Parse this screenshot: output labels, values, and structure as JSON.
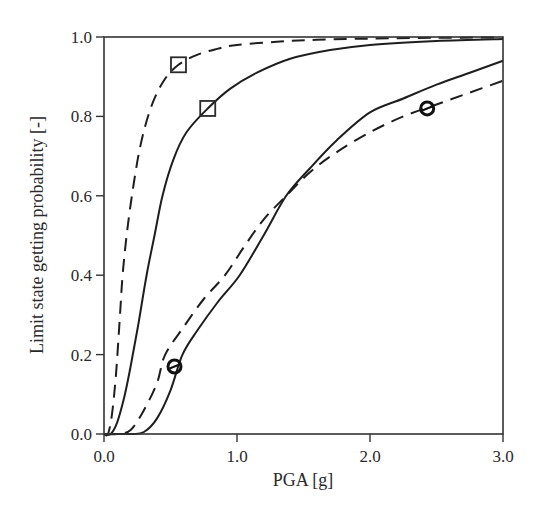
{
  "chart_data": {
    "type": "line",
    "title": "",
    "xlabel": "PGA  [g]",
    "ylabel": "Limit state getting probability [-]",
    "xlim": [
      0.0,
      3.0
    ],
    "ylim": [
      0.0,
      1.0
    ],
    "x_ticks": [
      "0.0",
      "1.0",
      "2.0",
      "3.0"
    ],
    "y_ticks": [
      "0.0",
      "0.2",
      "0.4",
      "0.6",
      "0.8",
      "1.0"
    ],
    "grid": false,
    "legend": null,
    "series": [
      {
        "name": "Square marker - dashed",
        "style": "dashed",
        "marker": "square",
        "marker_point": [
          0.56,
          0.93
        ],
        "points": [
          [
            0.0,
            0.0
          ],
          [
            0.03,
            0.0
          ],
          [
            0.06,
            0.05
          ],
          [
            0.09,
            0.15
          ],
          [
            0.12,
            0.3
          ],
          [
            0.14,
            0.4
          ],
          [
            0.17,
            0.5
          ],
          [
            0.21,
            0.6
          ],
          [
            0.27,
            0.72
          ],
          [
            0.35,
            0.82
          ],
          [
            0.45,
            0.89
          ],
          [
            0.56,
            0.93
          ],
          [
            0.7,
            0.955
          ],
          [
            0.85,
            0.97
          ],
          [
            1.0,
            0.98
          ],
          [
            1.3,
            0.988
          ],
          [
            1.6,
            0.993
          ],
          [
            2.0,
            0.996
          ],
          [
            2.5,
            0.998
          ],
          [
            3.0,
            0.999
          ]
        ]
      },
      {
        "name": "Square marker - solid",
        "style": "solid",
        "marker": "square",
        "marker_point": [
          0.78,
          0.82
        ],
        "points": [
          [
            0.0,
            0.0
          ],
          [
            0.05,
            0.0
          ],
          [
            0.1,
            0.03
          ],
          [
            0.15,
            0.09
          ],
          [
            0.2,
            0.17
          ],
          [
            0.26,
            0.28
          ],
          [
            0.32,
            0.4
          ],
          [
            0.38,
            0.5
          ],
          [
            0.44,
            0.6
          ],
          [
            0.52,
            0.69
          ],
          [
            0.62,
            0.76
          ],
          [
            0.78,
            0.82
          ],
          [
            0.95,
            0.87
          ],
          [
            1.15,
            0.91
          ],
          [
            1.4,
            0.945
          ],
          [
            1.7,
            0.967
          ],
          [
            2.0,
            0.98
          ],
          [
            2.5,
            0.99
          ],
          [
            3.0,
            0.995
          ]
        ]
      },
      {
        "name": "Circle marker - dashed",
        "style": "dashed",
        "marker": "circle",
        "marker_point": [
          0.53,
          0.17
        ],
        "points": [
          [
            0.0,
            0.0
          ],
          [
            0.1,
            0.0
          ],
          [
            0.2,
            0.01
          ],
          [
            0.3,
            0.06
          ],
          [
            0.4,
            0.13
          ],
          [
            0.46,
            0.2
          ],
          [
            0.6,
            0.27
          ],
          [
            0.75,
            0.34
          ],
          [
            0.91,
            0.4
          ],
          [
            1.05,
            0.47
          ],
          [
            1.2,
            0.54
          ],
          [
            1.37,
            0.6
          ],
          [
            1.55,
            0.66
          ],
          [
            1.75,
            0.71
          ],
          [
            2.0,
            0.76
          ],
          [
            2.25,
            0.8
          ],
          [
            2.5,
            0.83
          ],
          [
            2.75,
            0.86
          ],
          [
            3.0,
            0.89
          ]
        ]
      },
      {
        "name": "Circle marker - solid",
        "style": "solid",
        "marker": "circle",
        "marker_point": [
          2.43,
          0.82
        ],
        "points": [
          [
            0.0,
            0.0
          ],
          [
            0.2,
            0.0
          ],
          [
            0.3,
            0.005
          ],
          [
            0.4,
            0.04
          ],
          [
            0.5,
            0.11
          ],
          [
            0.59,
            0.2
          ],
          [
            0.7,
            0.26
          ],
          [
            0.85,
            0.33
          ],
          [
            1.02,
            0.4
          ],
          [
            1.2,
            0.5
          ],
          [
            1.37,
            0.6
          ],
          [
            1.55,
            0.67
          ],
          [
            1.75,
            0.74
          ],
          [
            2.0,
            0.81
          ],
          [
            2.25,
            0.845
          ],
          [
            2.5,
            0.88
          ],
          [
            2.75,
            0.91
          ],
          [
            3.0,
            0.94
          ]
        ]
      }
    ]
  }
}
